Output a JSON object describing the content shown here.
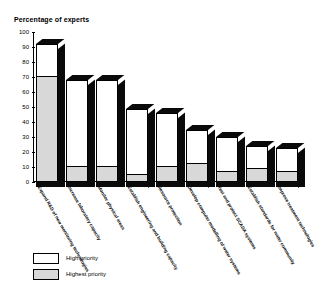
{
  "chart_data": {
    "type": "bar",
    "title": "Percentage of experts",
    "ylabel": "Percentage of experts",
    "xlabel": "",
    "ylim": [
      0,
      100
    ],
    "yticks": [
      0,
      10,
      20,
      30,
      40,
      50,
      60,
      70,
      80,
      90,
      100
    ],
    "grid": false,
    "stacked": true,
    "legend_position": "bottom-left",
    "categories": [
      "Expand R&D of new monitoring technologies",
      "Increase laboratory capacity",
      "Monitor physical areas",
      "Establish engineering and building capacity",
      "Resource protection",
      "Develop computer modelling of water systems",
      "Test and protect SCADA systems",
      "Establish standards for water community",
      "Improve treatment technologies"
    ],
    "series": [
      {
        "name": "Highest priority",
        "color": "#d8d8d8",
        "values": [
          70,
          10,
          10,
          5,
          10,
          12,
          7,
          9,
          7
        ]
      },
      {
        "name": "High priority",
        "color": "#ffffff",
        "values": [
          22,
          58,
          58,
          44,
          36,
          23,
          23,
          15,
          16
        ]
      }
    ],
    "totals": [
      92,
      68,
      68,
      49,
      46,
      35,
      30,
      24,
      23
    ]
  },
  "legend": {
    "items": [
      {
        "label": "High priority",
        "swatch": "white"
      },
      {
        "label": "Highest priority",
        "swatch": "gray"
      }
    ]
  }
}
